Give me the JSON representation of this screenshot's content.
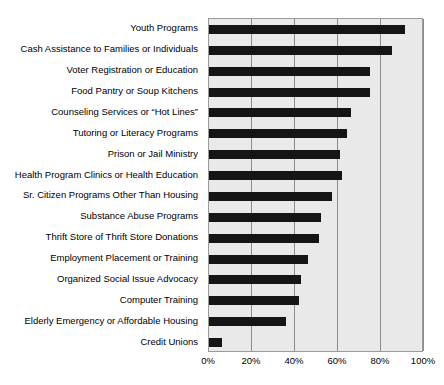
{
  "chart_data": {
    "type": "bar",
    "orientation": "horizontal",
    "title": "",
    "subtitle": "",
    "xlabel": "",
    "ylabel": "",
    "xlim": [
      0,
      100
    ],
    "xticks": [
      0,
      20,
      40,
      60,
      80,
      100
    ],
    "xtick_labels": [
      "0%",
      "20%",
      "40%",
      "60%",
      "80%",
      "100%"
    ],
    "grid": "vertical",
    "legend": "none",
    "bar_color": "#151515",
    "plot_background": "#e9e9e9",
    "categories": [
      "Youth Programs",
      "Cash Assistance to Families or Individuals",
      "Voter Registration or Education",
      "Food Pantry or Soup Kitchens",
      "Counseling Services or “Hot Lines”",
      "Tutoring or Literacy Programs",
      "Prison or Jail Ministry",
      "Health Program Clinics or Health Education",
      "Sr. Citizen Programs Other Than Housing",
      "Substance Abuse Programs",
      "Thrift Store of Thrift Store Donations",
      "Employment Placement or Training",
      "Organized Social Issue Advocacy",
      "Computer Training",
      "Elderly Emergency or Affordable Housing",
      "Credit Unions"
    ],
    "values": [
      91,
      85,
      75,
      75,
      66,
      64,
      61,
      62,
      57,
      52,
      51,
      46,
      43,
      42,
      36,
      6
    ]
  }
}
